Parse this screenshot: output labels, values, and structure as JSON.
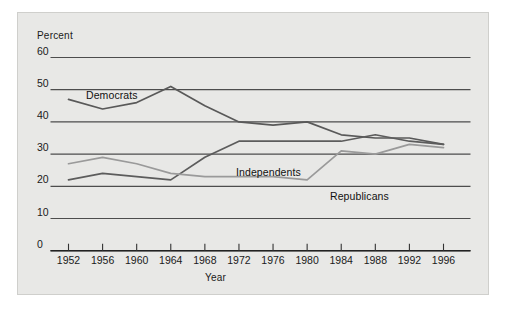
{
  "figure": {
    "panel_background": "#e8e8e6",
    "page_background": "#ffffff"
  },
  "labels": {
    "percent": "Percent",
    "year": "Year",
    "democrats": "Democrats",
    "independents": "Independents",
    "republicans": "Republicans"
  },
  "chart_data": {
    "type": "line",
    "title": "",
    "subtitle": "",
    "xlabel": "Year",
    "ylabel": "Percent",
    "xlim": [
      1950,
      1998
    ],
    "ylim": [
      0,
      60
    ],
    "yticks": [
      0,
      10,
      20,
      30,
      40,
      50,
      60
    ],
    "ytick_labels": [
      "0",
      "10",
      "20",
      "30",
      "40",
      "50",
      "60"
    ],
    "categories": [
      1952,
      1956,
      1960,
      1964,
      1968,
      1972,
      1976,
      1980,
      1984,
      1988,
      1992,
      1996
    ],
    "xtick_labels": [
      "1952",
      "1956",
      "1960",
      "1964",
      "1968",
      "1972",
      "1976",
      "1980",
      "1984",
      "1988",
      "1992",
      "1996"
    ],
    "grid": "horizontal",
    "legend": "inline-annotations",
    "series": [
      {
        "name": "Democrats",
        "color": "#595959",
        "values": [
          47,
          44,
          46,
          51,
          45,
          40,
          39,
          40,
          36,
          35,
          35,
          33
        ]
      },
      {
        "name": "Independents",
        "color": "#5c5c5c",
        "values": [
          22,
          24,
          23,
          22,
          29,
          34,
          34,
          34,
          34,
          36,
          34,
          33
        ]
      },
      {
        "name": "Republicans",
        "color": "#9a9a9a",
        "values": [
          27,
          29,
          27,
          24,
          23,
          23,
          23,
          22,
          31,
          30,
          33,
          32
        ]
      }
    ]
  }
}
